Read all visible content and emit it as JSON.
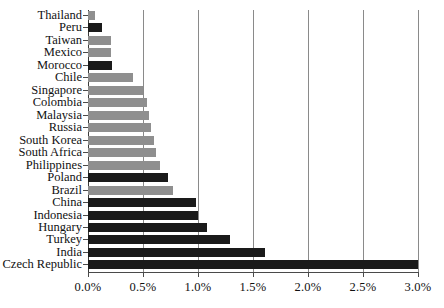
{
  "chart_data": {
    "type": "bar",
    "orientation": "horizontal",
    "title": "",
    "subtitle": "",
    "xlabel": "",
    "ylabel": "",
    "xlim": [
      0,
      3.0
    ],
    "xtick_labels": [
      "0.0%",
      "0.5%",
      "1.0%",
      "1.5%",
      "2.0%",
      "2.5%",
      "3.0%"
    ],
    "xtick_values": [
      0,
      0.5,
      1.0,
      1.5,
      2.0,
      2.5,
      3.0
    ],
    "xunit": "%",
    "grid": true,
    "grid_axis": "x",
    "legend": "none",
    "value_precision": 2,
    "colors": {
      "dark": "#1a1a1a",
      "light": "#8f8f8f",
      "gridline": "#8a8a8a",
      "axis": "#4a4a4a",
      "background": "#ffffff",
      "text": "#111111"
    },
    "categories": [
      "Thailand",
      "Peru",
      "Taiwan",
      "Mexico",
      "Morocco",
      "Chile",
      "Singapore",
      "Colombia",
      "Malaysia",
      "Russia",
      "South Korea",
      "South Africa",
      "Philippines",
      "Poland",
      "Brazil",
      "China",
      "Indonesia",
      "Hungary",
      "Turkey",
      "India",
      "Czech Republic"
    ],
    "values": [
      0.06,
      0.13,
      0.21,
      0.21,
      0.22,
      0.41,
      0.5,
      0.54,
      0.55,
      0.57,
      0.6,
      0.62,
      0.65,
      0.73,
      0.77,
      0.98,
      1.0,
      1.08,
      1.29,
      1.61,
      3.0
    ],
    "shades": [
      "light",
      "dark",
      "light",
      "light",
      "dark",
      "light",
      "light",
      "light",
      "light",
      "light",
      "light",
      "light",
      "light",
      "dark",
      "light",
      "dark",
      "dark",
      "dark",
      "dark",
      "dark",
      "dark"
    ]
  }
}
